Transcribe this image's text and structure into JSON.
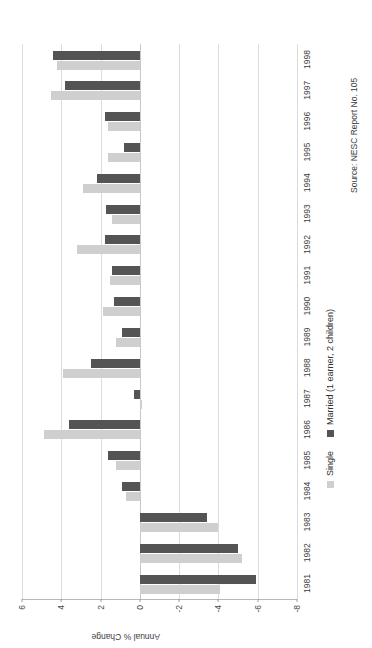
{
  "chart_data": {
    "type": "bar",
    "title": "",
    "xlabel": "",
    "ylabel": "Annual % Change",
    "ylim": [
      -8,
      6
    ],
    "yticks": [
      6,
      4,
      2,
      0,
      -2,
      -4,
      -6,
      -8
    ],
    "ytick_labels": [
      "6",
      "4",
      "2",
      "0",
      "-2",
      "-4",
      "-6",
      "-8"
    ],
    "grid": true,
    "legend_position": "bottom",
    "orientation": "rotated-90-ccw",
    "categories": [
      "1981",
      "1982",
      "1983",
      "1984",
      "1985",
      "1986",
      "1987",
      "1988",
      "1989",
      "1990",
      "1991",
      "1992",
      "1993",
      "1994",
      "1995",
      "1996",
      "1997",
      "1998"
    ],
    "series": [
      {
        "name": "Single",
        "color": "#cfcfcf",
        "values": [
          -4.1,
          -5.2,
          -4.0,
          0.7,
          1.2,
          4.9,
          -0.1,
          3.9,
          1.2,
          1.9,
          1.5,
          3.2,
          1.4,
          2.9,
          1.6,
          1.6,
          4.5,
          4.2
        ]
      },
      {
        "name": "Married (1 earner, 2 children)",
        "color": "#545454",
        "values": [
          -5.9,
          -5.0,
          -3.4,
          0.9,
          1.6,
          3.6,
          0.3,
          2.5,
          0.9,
          1.3,
          1.4,
          1.8,
          1.7,
          2.2,
          0.8,
          1.8,
          3.8,
          4.4
        ]
      }
    ],
    "source_note": "Source: NESC Report No. 105"
  },
  "legend": {
    "items": [
      {
        "label": "Single",
        "swatch": "single-swatch"
      },
      {
        "label": "Married (1 earner, 2 children)",
        "swatch": "married-swatch"
      }
    ]
  }
}
